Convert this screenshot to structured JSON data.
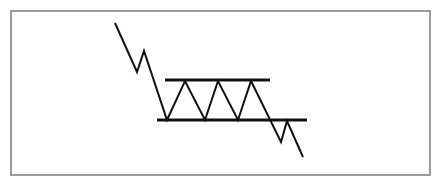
{
  "diagram": {
    "title": "",
    "type": "rectangle-consolidation-breakdown",
    "colors": {
      "background": "#ffffff",
      "frame": "#7a7a7a",
      "line": "#111111"
    },
    "frame": {
      "x": 11,
      "y": 11,
      "width": 419,
      "height": 164
    },
    "price_path": [
      [
        115,
        23
      ],
      [
        137,
        72
      ],
      [
        144,
        51
      ],
      [
        167,
        120
      ],
      [
        185,
        81
      ],
      [
        205,
        120
      ],
      [
        218,
        81
      ],
      [
        238,
        120
      ],
      [
        251,
        81
      ],
      [
        281,
        142
      ],
      [
        287,
        121
      ],
      [
        303,
        157
      ]
    ],
    "resistance_line": {
      "x1": 165,
      "y1": 80,
      "x2": 270,
      "y2": 80
    },
    "support_line": {
      "x1": 157,
      "y1": 120,
      "x2": 307,
      "y2": 120
    }
  }
}
